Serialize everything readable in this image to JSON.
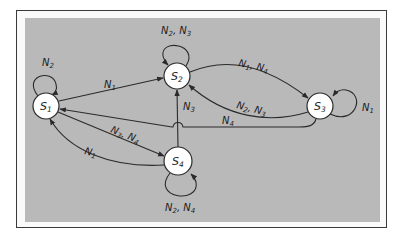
{
  "diagram": {
    "type": "state-transition-diagram",
    "colors": {
      "background": "#b9b9b9",
      "frame": "#3a3a3a",
      "node_fill": "#ffffff",
      "stroke": "#2a2a2a"
    },
    "states": [
      {
        "id": "S1",
        "base": "S",
        "sub": "1",
        "cx": 46,
        "cy": 106,
        "r": 13
      },
      {
        "id": "S2",
        "base": "S",
        "sub": "2",
        "cx": 177,
        "cy": 76,
        "r": 13
      },
      {
        "id": "S3",
        "base": "S",
        "sub": "3",
        "cx": 320,
        "cy": 106,
        "r": 13
      },
      {
        "id": "S4",
        "base": "S",
        "sub": "4",
        "cx": 178,
        "cy": 161,
        "r": 14
      }
    ],
    "transitions": [
      {
        "from": "S1",
        "to": "S1",
        "label": "N2",
        "parts": [
          [
            "N",
            "2"
          ]
        ]
      },
      {
        "from": "S1",
        "to": "S2",
        "label": "N1",
        "parts": [
          [
            "N",
            "1"
          ]
        ]
      },
      {
        "from": "S1",
        "to": "S4",
        "label": "N3, N4",
        "parts": [
          [
            "N",
            "3"
          ],
          [
            "N",
            "4"
          ]
        ]
      },
      {
        "from": "S2",
        "to": "S2",
        "label": "N2, N3",
        "parts": [
          [
            "N",
            "2"
          ],
          [
            "N",
            "3"
          ]
        ]
      },
      {
        "from": "S2",
        "to": "S3",
        "label": "N1, N4",
        "parts": [
          [
            "N",
            "1"
          ],
          [
            "N",
            "4"
          ]
        ]
      },
      {
        "from": "S3",
        "to": "S2",
        "label": "N2, N3",
        "parts": [
          [
            "N",
            "2"
          ],
          [
            "N",
            "3"
          ]
        ]
      },
      {
        "from": "S3",
        "to": "S3",
        "label": "N1",
        "parts": [
          [
            "N",
            "1"
          ]
        ]
      },
      {
        "from": "S3",
        "to": "S1",
        "label": "N4",
        "parts": [
          [
            "N",
            "4"
          ]
        ]
      },
      {
        "from": "S4",
        "to": "S2",
        "label": "N3",
        "parts": [
          [
            "N",
            "3"
          ]
        ]
      },
      {
        "from": "S4",
        "to": "S1",
        "label": "N1",
        "parts": [
          [
            "N",
            "1"
          ]
        ]
      },
      {
        "from": "S4",
        "to": "S4",
        "label": "N2, N4",
        "parts": [
          [
            "N",
            "2"
          ],
          [
            "N",
            "4"
          ]
        ]
      }
    ]
  }
}
